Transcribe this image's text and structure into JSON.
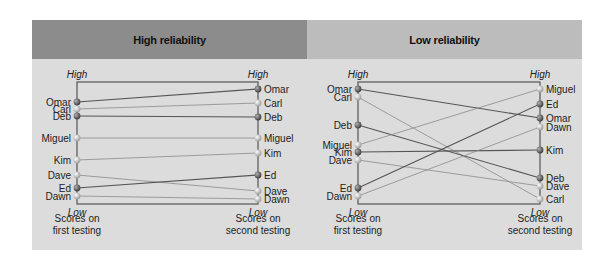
{
  "panels": [
    {
      "title": "High reliability",
      "axis_top_label": "High",
      "axis_bottom_label": "Low",
      "left_caption": [
        "Scores on",
        "first testing"
      ],
      "right_caption": [
        "Scores on",
        "second testing"
      ],
      "first": [
        {
          "name": "Omar",
          "y": 102,
          "dark": true
        },
        {
          "name": "Carl",
          "y": 109,
          "dark": false
        },
        {
          "name": "Deb",
          "y": 116,
          "dark": true
        },
        {
          "name": "Miguel",
          "y": 138,
          "dark": false
        },
        {
          "name": "Kim",
          "y": 160,
          "dark": false
        },
        {
          "name": "Dave",
          "y": 175,
          "dark": false
        },
        {
          "name": "Ed",
          "y": 188,
          "dark": true
        },
        {
          "name": "Dawn",
          "y": 196,
          "dark": false
        }
      ],
      "second": [
        {
          "name": "Omar",
          "y": 89,
          "dark": true
        },
        {
          "name": "Carl",
          "y": 103,
          "dark": false
        },
        {
          "name": "Deb",
          "y": 117,
          "dark": true
        },
        {
          "name": "Miguel",
          "y": 138,
          "dark": false
        },
        {
          "name": "Kim",
          "y": 153,
          "dark": false
        },
        {
          "name": "Ed",
          "y": 175,
          "dark": true
        },
        {
          "name": "Dave",
          "y": 191,
          "dark": false
        },
        {
          "name": "Dawn",
          "y": 199,
          "dark": false
        }
      ]
    },
    {
      "title": "Low reliability",
      "axis_top_label": "High",
      "axis_bottom_label": "Low",
      "left_caption": [
        "Scores on",
        "first testing"
      ],
      "right_caption": [
        "Scores on",
        "second testing"
      ],
      "first": [
        {
          "name": "Omar",
          "y": 89,
          "dark": true
        },
        {
          "name": "Carl",
          "y": 97,
          "dark": false
        },
        {
          "name": "Deb",
          "y": 125,
          "dark": true
        },
        {
          "name": "Miguel",
          "y": 145,
          "dark": false
        },
        {
          "name": "Kim",
          "y": 152,
          "dark": true
        },
        {
          "name": "Dave",
          "y": 160,
          "dark": false
        },
        {
          "name": "Ed",
          "y": 188,
          "dark": true
        },
        {
          "name": "Dawn",
          "y": 196,
          "dark": false
        }
      ],
      "second": [
        {
          "name": "Miguel",
          "y": 89,
          "dark": false
        },
        {
          "name": "Ed",
          "y": 104,
          "dark": true
        },
        {
          "name": "Omar",
          "y": 118,
          "dark": true
        },
        {
          "name": "Dawn",
          "y": 127,
          "dark": false
        },
        {
          "name": "Kim",
          "y": 150,
          "dark": true
        },
        {
          "name": "Deb",
          "y": 178,
          "dark": true
        },
        {
          "name": "Dave",
          "y": 186,
          "dark": false
        },
        {
          "name": "Carl",
          "y": 199,
          "dark": false
        }
      ]
    }
  ],
  "colors": {
    "dark_line": "#555555",
    "light_line": "#8a8a8a",
    "axis": "#555555",
    "dot_dark": "#6e6e6e",
    "dot_light": "#c4c4c4"
  }
}
